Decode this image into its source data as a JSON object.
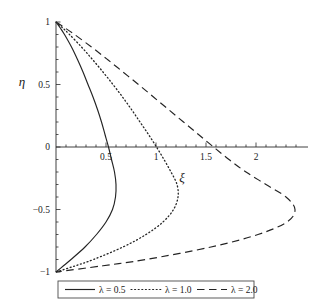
{
  "chart_data": {
    "type": "line",
    "title": "",
    "xlabel": "ξ",
    "ylabel": "η",
    "xlim": [
      0,
      2.45
    ],
    "ylim": [
      -1,
      1
    ],
    "grid": false,
    "legend_position": "bottom-center",
    "x_ticks": [
      {
        "value": 0.5,
        "label": "0.5"
      },
      {
        "value": 1.0,
        "label": "1"
      },
      {
        "value": 1.5,
        "label": "1.5"
      },
      {
        "value": 2.0,
        "label": "2"
      }
    ],
    "x_minor_tick_step": 0.1,
    "y_ticks": [
      {
        "value": 1.0,
        "label": "1"
      },
      {
        "value": 0.5,
        "label": "0.5"
      },
      {
        "value": 0.0,
        "label": "0"
      },
      {
        "value": -0.5,
        "label": "−0.5"
      },
      {
        "value": -1.0,
        "label": "−1"
      }
    ],
    "note": "Each curve is a closed-ended profile starting at (0,1) and ending at (0,-1), bulging toward positive xi. x = xi (horizontal), y = eta (vertical).",
    "series": [
      {
        "name": "λ = 0.5",
        "style": "solid",
        "max_xi": 0.6,
        "max_xi_at_eta": -0.3,
        "eta": [
          1.0,
          0.95,
          0.9,
          0.8,
          0.7,
          0.6,
          0.5,
          0.4,
          0.3,
          0.2,
          0.1,
          0.0,
          -0.1,
          -0.2,
          -0.3,
          -0.4,
          -0.5,
          -0.6,
          -0.7,
          -0.8,
          -0.9,
          -0.95,
          -1.0
        ],
        "xi": [
          0.0,
          0.045,
          0.085,
          0.155,
          0.215,
          0.27,
          0.32,
          0.37,
          0.415,
          0.455,
          0.49,
          0.525,
          0.555,
          0.585,
          0.6,
          0.595,
          0.565,
          0.5,
          0.405,
          0.29,
          0.15,
          0.075,
          0.0
        ]
      },
      {
        "name": "λ = 1.0",
        "style": "dotted",
        "max_xi": 1.22,
        "max_xi_at_eta": -0.33,
        "eta": [
          1.0,
          0.95,
          0.9,
          0.8,
          0.7,
          0.6,
          0.5,
          0.4,
          0.3,
          0.2,
          0.1,
          0.0,
          -0.1,
          -0.2,
          -0.3,
          -0.4,
          -0.5,
          -0.6,
          -0.7,
          -0.8,
          -0.9,
          -0.95,
          -1.0
        ],
        "xi": [
          0.0,
          0.07,
          0.135,
          0.255,
          0.365,
          0.47,
          0.57,
          0.665,
          0.755,
          0.84,
          0.925,
          1.005,
          1.08,
          1.15,
          1.21,
          1.22,
          1.175,
          1.07,
          0.9,
          0.67,
          0.375,
          0.195,
          0.0
        ]
      },
      {
        "name": "λ = 2.0",
        "style": "dashed",
        "max_xi": 2.39,
        "max_xi_at_eta": -0.38,
        "eta": [
          1.0,
          0.95,
          0.9,
          0.8,
          0.7,
          0.6,
          0.5,
          0.4,
          0.3,
          0.2,
          0.1,
          0.0,
          -0.1,
          -0.2,
          -0.3,
          -0.4,
          -0.5,
          -0.6,
          -0.7,
          -0.8,
          -0.9,
          -0.95,
          -1.0
        ],
        "xi": [
          0.0,
          0.095,
          0.185,
          0.355,
          0.515,
          0.67,
          0.825,
          0.975,
          1.125,
          1.275,
          1.425,
          1.575,
          1.73,
          1.9,
          2.1,
          2.3,
          2.39,
          2.31,
          2.02,
          1.55,
          0.9,
          0.47,
          0.0
        ]
      }
    ],
    "legend": [
      {
        "label": "λ = 0.5",
        "style": "solid"
      },
      {
        "label": "λ = 1.0",
        "style": "dotted"
      },
      {
        "label": "λ = 2.0",
        "style": "dashed"
      }
    ]
  }
}
